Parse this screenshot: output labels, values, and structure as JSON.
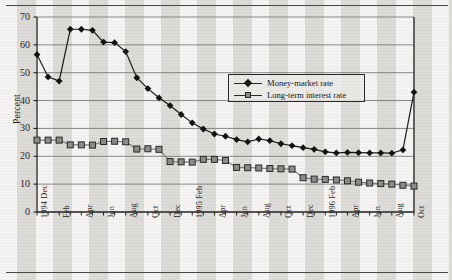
{
  "figure": {
    "background_color": "#e8e6e2",
    "has_top_rule": true,
    "has_bottom_rule": true
  },
  "chart_data": {
    "type": "line",
    "title": "",
    "xlabel": "",
    "ylabel": "Percent",
    "ylim": [
      0,
      70
    ],
    "ytick_values": [
      0,
      10,
      20,
      30,
      40,
      50,
      60,
      70
    ],
    "ytick_labels": [
      "0",
      "10",
      "20",
      "30",
      "40",
      "50",
      "60",
      "70"
    ],
    "grid": "horizontal",
    "legend_position": "upper-center-right",
    "x": [
      "1994 Dec",
      "1995 Jan",
      "1995 Feb",
      "1995 Mar",
      "1995 Apr",
      "1995 May",
      "1995 Jun",
      "1995 Jul",
      "1995 Aug",
      "1995 Sep",
      "1995 Oct",
      "1995 Nov",
      "1995 Dec",
      "1996 Jan",
      "1996 Feb",
      "1996 Mar",
      "1996 Apr",
      "1996 May",
      "1996 Jun",
      "1996 Jul",
      "1996 Aug",
      "1996 Sep",
      "1996 Oct",
      "1996 Nov",
      "1997 Jan",
      "1997 Feb",
      "1997 Mar",
      "1997 Apr",
      "1997 May",
      "1997 Jun",
      "1997 Jul",
      "1997 Aug",
      "1997 Sep",
      "1997 Oct",
      "1997 Nov"
    ],
    "xtick_labels": [
      "1994 Dec",
      "",
      "Feb",
      "",
      "Apr",
      "",
      "Jun",
      "",
      "Aug",
      "",
      "Oct",
      "",
      "Dec",
      "",
      "1995 Feb",
      "",
      "Apr",
      "",
      "Jun",
      "",
      "Aug",
      "",
      "Oct",
      "",
      "Dec",
      "",
      "1996 Feb",
      "",
      "Apr",
      "",
      "Jun",
      "",
      "Aug",
      "",
      "Oct"
    ],
    "series": [
      {
        "name": "Money-market rate",
        "marker": "diamond",
        "color": "#1b1a19",
        "values": [
          56.5,
          48.5,
          47.0,
          65.6,
          65.6,
          65.2,
          61.0,
          60.8,
          57.6,
          48.2,
          44.3,
          41.0,
          38.2,
          35.0,
          32.0,
          29.8,
          28.0,
          27.2,
          26.0,
          25.2,
          26.2,
          25.6,
          24.5,
          23.8,
          23.1,
          22.5,
          21.6,
          21.2,
          21.4,
          21.3,
          21.2,
          21.2,
          21.1,
          22.3,
          43.0
        ]
      },
      {
        "name": "Long-term interest rate",
        "marker": "square",
        "color": "#8d8c8a",
        "values": [
          25.8,
          25.8,
          25.8,
          24.1,
          24.1,
          24.0,
          25.3,
          25.4,
          25.2,
          22.6,
          22.7,
          22.5,
          18.1,
          18.0,
          17.9,
          18.9,
          18.9,
          18.5,
          16.0,
          15.9,
          15.8,
          15.6,
          15.5,
          15.4,
          12.3,
          11.8,
          11.7,
          11.5,
          11.2,
          10.7,
          10.4,
          10.2,
          10.0,
          9.6,
          9.3
        ]
      }
    ]
  },
  "legend": {
    "items": [
      {
        "label": "Money-market rate",
        "symbol": "diamond-marker-icon"
      },
      {
        "label": "Long-term interest rate",
        "symbol": "square-marker-icon"
      }
    ]
  }
}
